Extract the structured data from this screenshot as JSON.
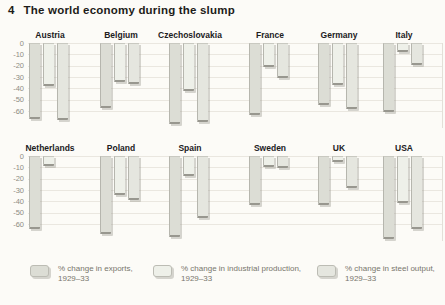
{
  "figure": {
    "number": "4",
    "title": "The world economy during the slump"
  },
  "y_axis": {
    "tick_labels": [
      "0",
      "-10",
      "-20",
      "-30",
      "-40",
      "-50",
      "-60"
    ]
  },
  "legend": {
    "items": [
      {
        "line1": "% change in exports,",
        "line2": "1929–33",
        "swatch": "exports"
      },
      {
        "line1": "% change in industrial production,",
        "line2": "1929–33",
        "swatch": "industrial_production"
      },
      {
        "line1": "% change in steel output,",
        "line2": "1929–33",
        "swatch": "steel_output"
      }
    ]
  },
  "colors": {
    "exports": "#dcddd5",
    "industrial_production": "#eef0e9",
    "steel_output": "#e5e6df",
    "gridline": "#eae7e0",
    "axis_text": "#8e8c82",
    "title_text": "#1d1c19"
  },
  "chart_data": {
    "type": "bar",
    "title": "4 The world economy during the slump",
    "unit": "% change 1929–33",
    "categories": [
      "Austria",
      "Belgium",
      "Czechoslovakia",
      "France",
      "Germany",
      "Italy",
      "Netherlands",
      "Poland",
      "Spain",
      "Sweden",
      "UK",
      "USA"
    ],
    "series": [
      {
        "name": "% change in exports, 1929–33",
        "values": [
          -67,
          -57,
          -71,
          -63,
          -55,
          -61,
          -64,
          -69,
          -71,
          -43,
          -43,
          -73
        ]
      },
      {
        "name": "% change in industrial production, 1929–33",
        "values": [
          -38,
          -34,
          -42,
          -21,
          -37,
          -8,
          -9,
          -34,
          -18,
          -10,
          -5,
          -41
        ]
      },
      {
        "name": "% change in steel output, 1929–33",
        "values": [
          -68,
          -36,
          -70,
          -31,
          -58,
          -19,
          null,
          -39,
          -55,
          -11,
          -28,
          -64
        ]
      }
    ],
    "ylim": [
      -75,
      0
    ],
    "yticks": [
      0,
      -10,
      -20,
      -30,
      -40,
      -50,
      -60
    ],
    "grid": "horizontal",
    "legend_position": "bottom",
    "layout": "two rows of six countries"
  }
}
